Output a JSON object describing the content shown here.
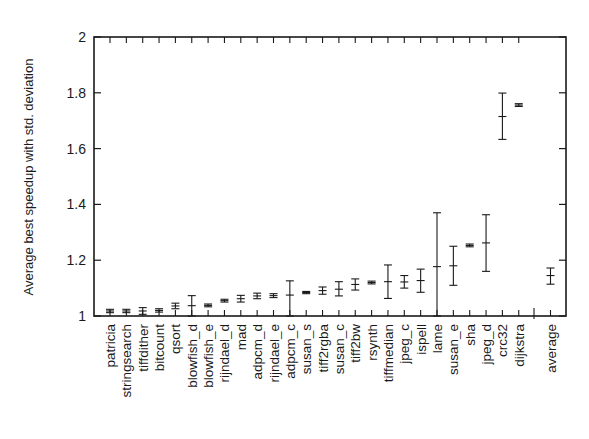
{
  "chart_data": {
    "type": "scatter",
    "subtype": "errorbar",
    "title": "",
    "xlabel": "",
    "ylabel": "Average best speedup with std. deviation",
    "ylim": [
      1,
      2
    ],
    "yticks": [
      1,
      1.2,
      1.4,
      1.6,
      1.8,
      2
    ],
    "ytick_labels": [
      "1",
      "1.2",
      "1.4",
      "1.6",
      "1.8",
      "2"
    ],
    "grid": false,
    "legend": null,
    "categories": [
      "patricia",
      "stringsearch",
      "tiffdither",
      "bitcount",
      "qsort",
      "blowfish_d",
      "blowfish_e",
      "rijndael_d",
      "mad",
      "adpcm_d",
      "rijndael_e",
      "adpcm_c",
      "susan_s",
      "tiff2rgba",
      "susan_c",
      "tiff2bw",
      "rsynth",
      "tiffmedian",
      "jpeg_c",
      "ispell",
      "lame",
      "susan_e",
      "sha",
      "jpeg_d",
      "crc32",
      "dijkstra",
      "average"
    ],
    "values": [
      1.018,
      1.018,
      1.018,
      1.02,
      1.036,
      1.037,
      1.038,
      1.055,
      1.062,
      1.072,
      1.073,
      1.075,
      1.084,
      1.091,
      1.096,
      1.113,
      1.12,
      1.123,
      1.122,
      1.127,
      1.177,
      1.18,
      1.253,
      1.262,
      1.715,
      1.756,
      1.145
    ],
    "err_low": [
      1.012,
      1.012,
      1.006,
      1.014,
      1.026,
      1.0,
      1.033,
      1.05,
      1.05,
      1.062,
      1.066,
      1.0,
      1.08,
      1.078,
      1.072,
      1.093,
      1.115,
      1.063,
      1.1,
      1.085,
      1.0,
      1.11,
      1.248,
      1.16,
      1.633,
      1.751,
      1.114
    ],
    "err_high": [
      1.024,
      1.024,
      1.03,
      1.026,
      1.046,
      1.073,
      1.043,
      1.06,
      1.074,
      1.082,
      1.08,
      1.126,
      1.088,
      1.104,
      1.123,
      1.133,
      1.125,
      1.183,
      1.145,
      1.168,
      1.37,
      1.25,
      1.258,
      1.363,
      1.799,
      1.761,
      1.172
    ]
  }
}
